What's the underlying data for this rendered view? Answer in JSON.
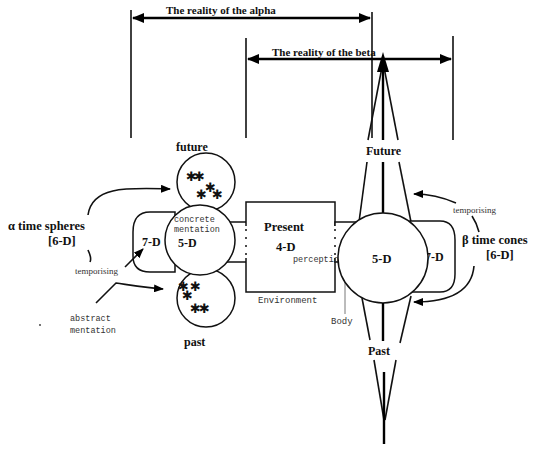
{
  "diagram": {
    "headers": {
      "alpha_reality": "The reality of the alpha",
      "beta_reality": "The reality of the beta"
    },
    "alpha": {
      "label": "α time spheres",
      "dimension": "[6-D]",
      "future_label": "future",
      "past_label": "past",
      "sphere_5d": "5-D",
      "sphere_7d": "7-D",
      "concrete_line1": "concrete",
      "concrete_line2": "mentation",
      "abstract_line1": "abstract",
      "abstract_line2": "mentation",
      "temporising": "temporising",
      "star_glyph": "✱"
    },
    "present": {
      "title": "Present",
      "dimension": "4-D",
      "perception": "perception",
      "environment": "Environment",
      "body": "Body"
    },
    "beta": {
      "label": "β  time cones",
      "dimension": "[6-D]",
      "future_label": "Future",
      "past_label": "Past",
      "sphere_5d": "5-D",
      "sphere_7d": "7-D",
      "temporising": "temporising"
    }
  }
}
